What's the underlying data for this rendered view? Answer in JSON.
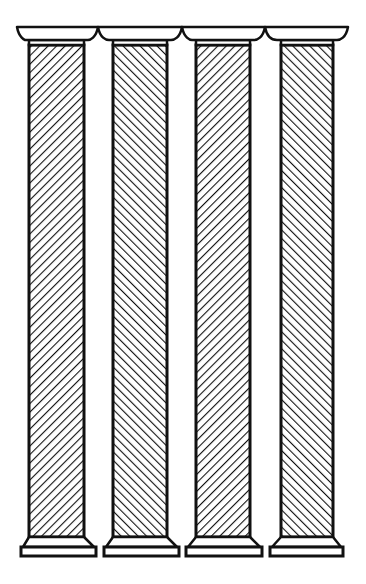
{
  "figure": {
    "column_count": 4,
    "colors": {
      "ink": "#111111",
      "background": "#ffffff"
    },
    "columns": [
      {
        "id": 1,
        "hatch": "backslash",
        "capital": [
          17,
          98
        ],
        "shaft": [
          29,
          84
        ],
        "base": [
          21,
          96
        ]
      },
      {
        "id": 2,
        "hatch": "slash",
        "capital": [
          98,
          182
        ],
        "shaft": [
          113,
          167
        ],
        "base": [
          104,
          179
        ]
      },
      {
        "id": 3,
        "hatch": "backslash",
        "capital": [
          182,
          265
        ],
        "shaft": [
          196,
          250
        ],
        "base": [
          186,
          262
        ]
      },
      {
        "id": 4,
        "hatch": "slash",
        "capital": [
          265,
          348
        ],
        "shaft": [
          281,
          333
        ],
        "base": [
          270,
          343
        ]
      }
    ]
  }
}
